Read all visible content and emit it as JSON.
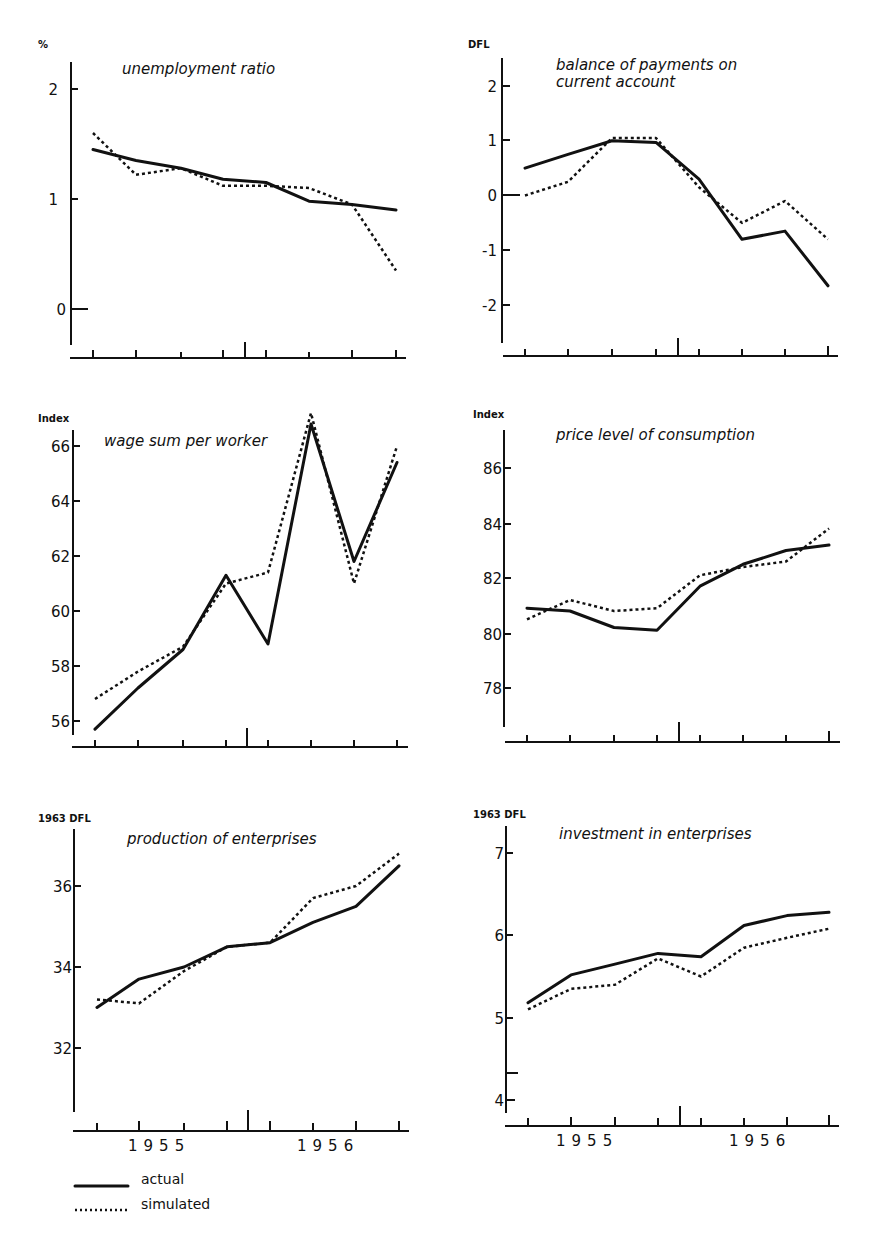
{
  "legend": {
    "actual_label": "actual",
    "simulated_label": "simulated"
  },
  "chart_data": [
    {
      "type": "line",
      "title": "unemployment ratio",
      "ylabel": "%",
      "yticks": [
        "0",
        "1",
        "2"
      ],
      "ylim": [
        -0.3,
        2.2
      ],
      "x": [
        1,
        2,
        3,
        4,
        5,
        6,
        7,
        8
      ],
      "xlabels": [],
      "series": [
        {
          "name": "actual",
          "values": [
            1.45,
            1.35,
            1.28,
            1.18,
            1.15,
            0.98,
            0.95,
            0.9
          ]
        },
        {
          "name": "simulated",
          "values": [
            1.6,
            1.22,
            1.28,
            1.12,
            1.12,
            1.1,
            0.95,
            0.35
          ]
        }
      ]
    },
    {
      "type": "line",
      "title": "balance of payments on current account",
      "title_lines": [
        "balance of payments on",
        "current account"
      ],
      "ylabel": "DFL",
      "yticks": [
        "-2",
        "-1",
        "0",
        "1",
        "2"
      ],
      "ylim": [
        -2.8,
        2.5
      ],
      "x": [
        1,
        2,
        3,
        4,
        5,
        6,
        7,
        8
      ],
      "xlabels": [],
      "series": [
        {
          "name": "actual",
          "values": [
            0.5,
            0.75,
            1.0,
            0.97,
            0.3,
            -0.8,
            -0.65,
            -1.65
          ]
        },
        {
          "name": "simulated",
          "values": [
            0.0,
            0.25,
            1.05,
            1.05,
            0.15,
            -0.5,
            -0.1,
            -0.8
          ]
        }
      ]
    },
    {
      "type": "line",
      "title": "wage sum per worker",
      "ylabel": "Index",
      "yticks": [
        "56",
        "58",
        "60",
        "62",
        "64",
        "66"
      ],
      "ylim": [
        55.5,
        67.3
      ],
      "x": [
        1,
        2,
        3,
        4,
        5,
        6,
        7,
        8
      ],
      "xlabels": [],
      "series": [
        {
          "name": "actual",
          "values": [
            55.7,
            57.2,
            58.6,
            61.3,
            58.8,
            66.8,
            61.8,
            65.4
          ]
        },
        {
          "name": "simulated",
          "values": [
            56.8,
            57.8,
            58.7,
            61.0,
            61.4,
            67.2,
            61.0,
            66.0
          ]
        }
      ]
    },
    {
      "type": "line",
      "title": "price level of consumption",
      "ylabel": "Index",
      "yticks": [
        "78",
        "80",
        "82",
        "84",
        "86"
      ],
      "ylim": [
        76.5,
        87.2
      ],
      "x": [
        1,
        2,
        3,
        4,
        5,
        6,
        7,
        8
      ],
      "xlabels": [],
      "series": [
        {
          "name": "actual",
          "values": [
            80.9,
            80.8,
            80.2,
            80.1,
            81.7,
            82.5,
            83.0,
            83.2
          ]
        },
        {
          "name": "simulated",
          "values": [
            80.5,
            81.2,
            80.8,
            80.9,
            82.1,
            82.4,
            82.6,
            83.8
          ]
        }
      ]
    },
    {
      "type": "line",
      "title": "production of enterprises",
      "ylabel": "1963 DFL",
      "yticks": [
        "32",
        "34",
        "36"
      ],
      "ylim": [
        30.5,
        37.5
      ],
      "x": [
        1,
        2,
        3,
        4,
        5,
        6,
        7,
        8
      ],
      "xlabels": [
        "1955",
        "1956"
      ],
      "series": [
        {
          "name": "actual",
          "values": [
            33.0,
            33.7,
            34.0,
            34.5,
            34.6,
            35.1,
            35.5,
            36.5
          ]
        },
        {
          "name": "simulated",
          "values": [
            33.2,
            33.1,
            33.9,
            34.5,
            34.6,
            35.7,
            36.0,
            36.8
          ]
        }
      ]
    },
    {
      "type": "line",
      "title": "investment in enterprises",
      "ylabel": "1963 DFL",
      "yticks": [
        "4",
        "5",
        "6",
        "7"
      ],
      "ylim": [
        3.9,
        7.3
      ],
      "x": [
        1,
        2,
        3,
        4,
        5,
        6,
        7,
        8
      ],
      "xlabels": [
        "1955",
        "1956"
      ],
      "series": [
        {
          "name": "actual",
          "values": [
            5.18,
            5.52,
            5.65,
            5.78,
            5.74,
            6.12,
            6.24,
            6.28
          ]
        },
        {
          "name": "simulated",
          "values": [
            5.1,
            5.35,
            5.4,
            5.72,
            5.5,
            5.85,
            5.97,
            6.08
          ]
        }
      ]
    }
  ]
}
